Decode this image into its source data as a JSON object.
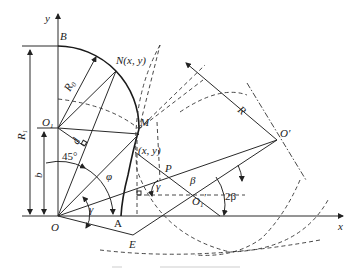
{
  "figure": {
    "labels": {
      "y_axis": "y",
      "x_axis": "x",
      "B": "B",
      "N": "N(x, y)",
      "R0": "R",
      "R0_sub": "0",
      "O1": "O",
      "O1_sub": "1",
      "M": "M",
      "xy": "(x, y)",
      "R1": "R",
      "R1_sub": "1",
      "b": "b",
      "angle45": "45°",
      "phi": "φ",
      "d": "d",
      "gamma_O": "γ",
      "gamma_P": "γ",
      "O": "O",
      "A": "A",
      "E": "E",
      "P": "P",
      "beta": "β",
      "O1prime": "O",
      "O1prime_sub": "1",
      "O1prime_mark": "′",
      "two_beta": "2β",
      "Oprime": "O′",
      "R": "R"
    },
    "caption_visible": false
  }
}
